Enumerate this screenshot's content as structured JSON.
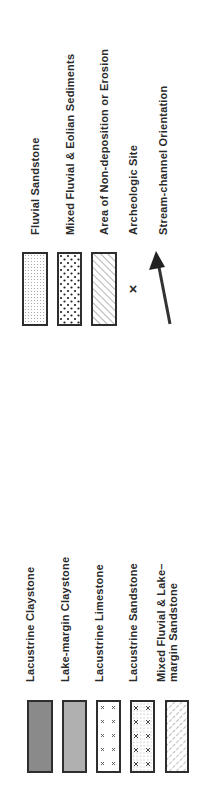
{
  "legend_top": {
    "items": [
      {
        "label": "Fluvial  Sandstone",
        "pattern": "fine-dots"
      },
      {
        "label": "Mixed Fluvial & Eolian Sediments",
        "pattern": "coarse-dots"
      },
      {
        "label": "Area of Non-deposition or Erosion",
        "pattern": "diagonal-hatch"
      },
      {
        "label": "Archeologic  Site",
        "symbol": "x-mark",
        "glyph": "×"
      },
      {
        "label": "Stream-channel Orientation",
        "symbol": "arrow"
      }
    ]
  },
  "legend_bottom": {
    "items": [
      {
        "label": "Lacustrine  Claystone",
        "pattern": "dark-gray-fill",
        "color": "#8a8a8a"
      },
      {
        "label": "Lake-margin  Claystone",
        "pattern": "light-gray-fill",
        "color": "#b0b0b0"
      },
      {
        "label": "Lacustrine  Limestone",
        "pattern": "x-marks"
      },
      {
        "label": "Lacustrine  Sandstone",
        "pattern": "x-marks-and-dots"
      },
      {
        "label": "Mixed Fluvial & Lake–",
        "label_line2": "margin  Sandstone",
        "pattern": "dashed-diagonal"
      }
    ]
  }
}
